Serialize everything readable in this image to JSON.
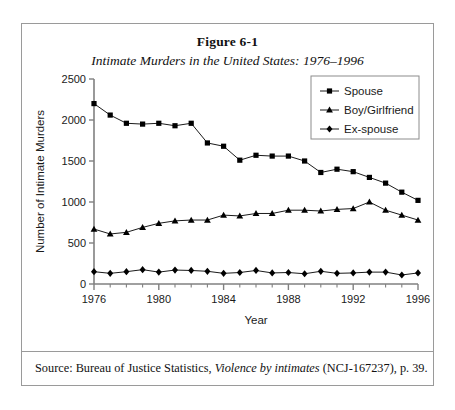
{
  "figure": {
    "number": "Figure 6-1",
    "subtitle": "Intimate Murders in the United States: 1976–1996"
  },
  "source": {
    "prefix": "Source: Bureau of Justice Statistics,",
    "italic_title": "Violence by intimates",
    "suffix": "(NCJ-167237), p. 39."
  },
  "colors": {
    "line": "#000000",
    "marker": "#000000",
    "axis": "#808080",
    "frame": "#9a9a9a",
    "background": "#ffffff",
    "text": "#1a1a1a"
  },
  "chart_data": {
    "type": "line",
    "title": "Intimate Murders in the United States: 1976–1996",
    "xlabel": "Year",
    "ylabel": "Number of Intimate Murders",
    "xlim": [
      1976,
      1996
    ],
    "ylim": [
      0,
      2500
    ],
    "ytick_values": [
      0,
      500,
      1000,
      1500,
      2000,
      2500
    ],
    "ytick_labels": [
      "0",
      "500",
      "1000",
      "1500",
      "2000",
      "2500"
    ],
    "xtick_values": [
      1976,
      1980,
      1984,
      1988,
      1992,
      1996
    ],
    "xtick_labels": [
      "1976",
      "1980",
      "1984",
      "1988",
      "1992",
      "1996"
    ],
    "xminor_values": [
      1977,
      1978,
      1979,
      1981,
      1982,
      1983,
      1985,
      1986,
      1987,
      1989,
      1990,
      1991,
      1993,
      1994,
      1995
    ],
    "grid": false,
    "legend_position": "top-right",
    "x": [
      1976,
      1977,
      1978,
      1979,
      1980,
      1981,
      1982,
      1983,
      1984,
      1985,
      1986,
      1987,
      1988,
      1989,
      1990,
      1991,
      1992,
      1993,
      1994,
      1995,
      1996
    ],
    "series": [
      {
        "name": "Spouse",
        "marker": "square",
        "values": [
          2200,
          2060,
          1960,
          1950,
          1960,
          1930,
          1960,
          1720,
          1680,
          1510,
          1570,
          1560,
          1560,
          1500,
          1360,
          1400,
          1370,
          1300,
          1230,
          1120,
          1020
        ]
      },
      {
        "name": "Boy/Girlfriend",
        "marker": "triangle",
        "values": [
          670,
          610,
          630,
          690,
          740,
          770,
          780,
          780,
          840,
          830,
          860,
          860,
          900,
          900,
          890,
          910,
          920,
          1000,
          900,
          840,
          780
        ]
      },
      {
        "name": "Ex-spouse",
        "marker": "diamond",
        "values": [
          150,
          130,
          150,
          175,
          145,
          170,
          165,
          155,
          130,
          140,
          165,
          135,
          140,
          125,
          155,
          130,
          135,
          145,
          145,
          110,
          135
        ]
      }
    ]
  },
  "legend": {
    "items": [
      {
        "label": "Spouse",
        "marker": "square"
      },
      {
        "label": "Boy/Girlfriend",
        "marker": "triangle"
      },
      {
        "label": "Ex-spouse",
        "marker": "diamond"
      }
    ]
  }
}
